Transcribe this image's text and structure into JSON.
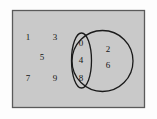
{
  "figure": {
    "type": "venn-diagram",
    "background_color": "#fdfdfd",
    "universe_fill": "#c9c9c9",
    "universe_border_color": "#5a5a5a",
    "shape_stroke_color": "#1a1a1a",
    "label_color": "#151515"
  },
  "universe": {
    "name": "universal-set-rectangle",
    "x": 12,
    "y": 10,
    "width": 133,
    "height": 98
  },
  "circle_large": {
    "name": "large-circle",
    "cx": 102.5,
    "cy": 61,
    "r": 30.5
  },
  "ellipse_small": {
    "name": "small-ellipse",
    "cx": 81.5,
    "cy": 60.5,
    "rx": 10,
    "ry": 27.5
  },
  "elements": {
    "outside": [
      {
        "value": "1",
        "x": 28,
        "y": 38
      },
      {
        "value": "3",
        "x": 55,
        "y": 38
      },
      {
        "value": "5",
        "x": 42,
        "y": 58
      },
      {
        "value": "7",
        "x": 28,
        "y": 79
      },
      {
        "value": "9",
        "x": 55,
        "y": 79
      }
    ],
    "ellipse_only": [
      {
        "value": "0",
        "x": 81,
        "y": 44
      },
      {
        "value": "4",
        "x": 81,
        "y": 61
      },
      {
        "value": "8",
        "x": 81,
        "y": 79
      }
    ],
    "circle_only": [
      {
        "value": "2",
        "x": 108,
        "y": 50
      },
      {
        "value": "6",
        "x": 108,
        "y": 66
      }
    ]
  }
}
